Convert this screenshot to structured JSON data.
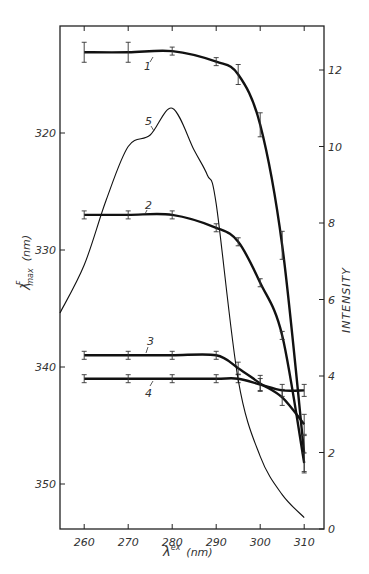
{
  "chart_data": {
    "type": "line",
    "title": "",
    "xlabel": "λ^ex (nm)",
    "ylabel_left": "λ^F_max (nm)",
    "ylabel_right": "INTENSITY",
    "xlim": [
      254.5,
      314.5
    ],
    "ylim_left": [
      313.5,
      354.5
    ],
    "ylim_left_inverted": true,
    "ylim_right": [
      0,
      12.3
    ],
    "x_ticks": [
      260,
      270,
      280,
      290,
      300,
      310
    ],
    "x_tick_labels": [
      "260",
      "270",
      "280",
      "290",
      "300",
      "310"
    ],
    "y_left_ticks": [
      320,
      330,
      340,
      350
    ],
    "y_right_ticks": [
      0,
      2,
      4,
      6,
      8,
      10,
      12
    ],
    "grid": false,
    "legend": "inline curve labels 1–5",
    "series": [
      {
        "name": "1",
        "axis": "left",
        "error_bars": true,
        "x": [
          260,
          270,
          280,
          290,
          295,
          300,
          305,
          310
        ],
        "values": [
          313.1,
          313.1,
          313.0,
          313.9,
          315.0,
          319.3,
          329.6,
          347.4
        ]
      },
      {
        "name": "2",
        "axis": "left",
        "error_bars": true,
        "x": [
          260,
          270,
          280,
          290,
          295,
          300,
          305,
          310
        ],
        "values": [
          327.0,
          327.0,
          327.0,
          328.1,
          329.3,
          332.8,
          337.3,
          348.2
        ]
      },
      {
        "name": "3",
        "axis": "left",
        "error_bars": true,
        "x": [
          260,
          270,
          280,
          290,
          295,
          300,
          305,
          310
        ],
        "values": [
          339.0,
          339.0,
          339.0,
          339.0,
          340.1,
          341.4,
          342.6,
          344.9
        ]
      },
      {
        "name": "4",
        "axis": "left",
        "error_bars": true,
        "x": [
          260,
          270,
          280,
          290,
          295,
          300,
          305,
          310
        ],
        "values": [
          341.0,
          341.0,
          341.0,
          341.0,
          341.0,
          341.5,
          342.0,
          342.0
        ]
      },
      {
        "name": "5",
        "axis": "right",
        "error_bars": false,
        "x": [
          254.5,
          260,
          265,
          270,
          275,
          280,
          285,
          288,
          290,
          295,
          300,
          305,
          310
        ],
        "values": [
          5.65,
          6.9,
          8.6,
          10.0,
          10.3,
          11.0,
          9.9,
          9.25,
          8.5,
          3.9,
          1.9,
          0.9,
          0.3
        ]
      }
    ]
  },
  "labels": {
    "x_axis_title": "λ",
    "x_axis_sup": "ex",
    "x_axis_unit": "(nm)",
    "y_left_title": "λ",
    "y_left_sup": "F",
    "y_left_sub": "max",
    "y_left_unit": "(nm)",
    "y_right_title": "INTENSITY",
    "curve_1": "1",
    "curve_2": "2",
    "curve_3": "3",
    "curve_4": "4",
    "curve_5": "5"
  }
}
